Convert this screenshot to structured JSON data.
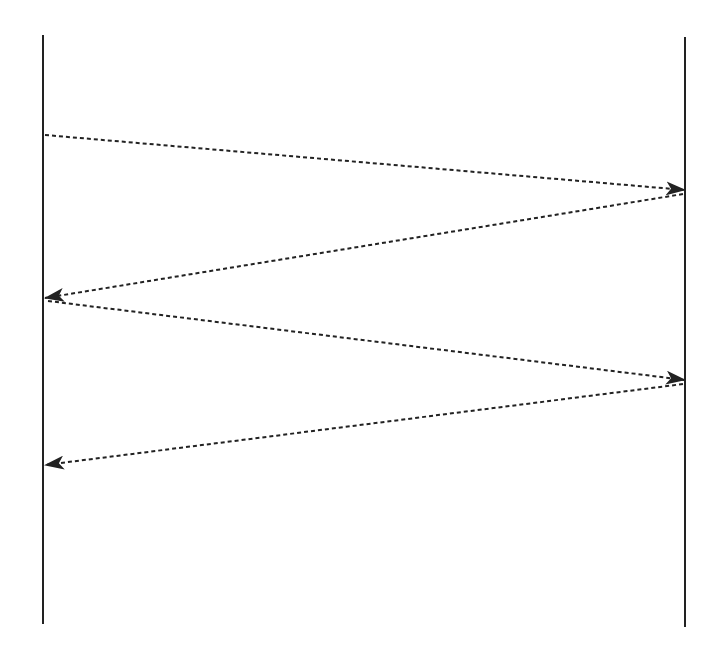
{
  "diagram": {
    "type": "sequence",
    "background": "#ffffff",
    "line_color": "#222222",
    "lifelines": [
      {
        "id": "left",
        "x": 43,
        "y1": 35,
        "y2": 624
      },
      {
        "id": "right",
        "x": 685,
        "y1": 37,
        "y2": 627
      }
    ],
    "messages": [
      {
        "from": "left",
        "to": "right",
        "x1": 45,
        "y1": 135,
        "x2": 685,
        "y2": 190,
        "style": "dashed"
      },
      {
        "from": "right",
        "to": "left",
        "x1": 683,
        "y1": 194,
        "x2": 45,
        "y2": 298,
        "style": "dashed"
      },
      {
        "from": "left",
        "to": "right",
        "x1": 48,
        "y1": 301,
        "x2": 685,
        "y2": 380,
        "style": "dashed"
      },
      {
        "from": "right",
        "to": "left",
        "x1": 683,
        "y1": 384,
        "x2": 45,
        "y2": 465,
        "style": "dashed"
      }
    ]
  }
}
